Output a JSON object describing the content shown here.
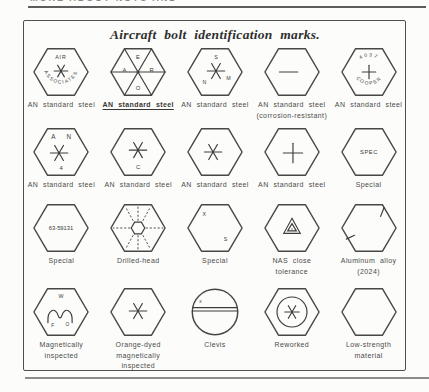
{
  "page": {
    "header_fragment": "MORE ABOUT NUTS AND BOLTS",
    "title": "Aircraft bolt identification marks."
  },
  "colors": {
    "ink": "#3c3c3c",
    "rule": "#5c5c5c",
    "paper": "#fcfcfa"
  },
  "cells": [
    {
      "name": "air-associates-bolt",
      "symbol": "asterisk",
      "marks": {
        "top": "AIR",
        "arc": "ASSOCIATES"
      },
      "label": [
        "AN standard steel"
      ]
    },
    {
      "name": "aero-spokes-bolt",
      "symbol": "six-spokes",
      "marks": {
        "top": "E",
        "left": "A",
        "right": "R",
        "bottom": "O"
      },
      "label": [
        "AN standard steel"
      ]
    },
    {
      "name": "snm-asterisk-bolt",
      "symbol": "asterisk",
      "marks": {
        "top": "S",
        "left": "N",
        "right": "M"
      },
      "label": [
        "AN standard steel"
      ]
    },
    {
      "name": "dash-bolt",
      "symbol": "single-dash",
      "marks": {},
      "label": [
        "AN standard steel",
        "(corrosion-resistant)"
      ]
    },
    {
      "name": "cooper-bolt",
      "symbol": "plus",
      "marks": {
        "arc_top": "4037",
        "arc_bottom": "COOPER"
      },
      "label": [
        "AN standard steel"
      ]
    },
    {
      "name": "an4-bolt",
      "symbol": "asterisk",
      "marks": {
        "left": "A",
        "right": "N",
        "bottom": "4"
      },
      "label": [
        "AN standard steel"
      ]
    },
    {
      "name": "c-asterisk-bolt",
      "symbol": "asterisk",
      "marks": {
        "bottom": "C"
      },
      "label": [
        "AN standard steel"
      ]
    },
    {
      "name": "asterisk-bolt",
      "symbol": "asterisk",
      "marks": {},
      "label": [
        "AN standard steel"
      ]
    },
    {
      "name": "plus-bolt",
      "symbol": "plus",
      "marks": {},
      "label": [
        "AN standard steel"
      ]
    },
    {
      "name": "spec-bolt",
      "symbol": "text-only",
      "marks": {
        "center": "SPEC"
      },
      "label": [
        "Special"
      ]
    },
    {
      "name": "part-number-bolt",
      "symbol": "text-only",
      "marks": {
        "center": "63-59131"
      },
      "label": [
        "Special"
      ]
    },
    {
      "name": "drilled-head-bolt",
      "symbol": "drilled-head-radials",
      "marks": {},
      "label": [
        "Drilled-head"
      ]
    },
    {
      "name": "xs-bolt",
      "symbol": "letters",
      "marks": {
        "top_left": "X",
        "bottom_right": "S"
      },
      "label": [
        "Special"
      ]
    },
    {
      "name": "nas-triangle-bolt",
      "symbol": "nested-triangle",
      "marks": {
        "inner": "x"
      },
      "label": [
        "NAS close",
        "tolerance"
      ]
    },
    {
      "name": "aluminum-alloy-bolt",
      "symbol": "raised-dashes",
      "marks": {},
      "label": [
        "Aluminum alloy",
        "(2024)"
      ]
    },
    {
      "name": "magnetic-inspected-bolt",
      "symbol": "m-arch-logo",
      "marks": {
        "top": "W",
        "bottom_left": "F",
        "bottom_right": "O"
      },
      "label": [
        "Magnetically",
        "inspected"
      ]
    },
    {
      "name": "orange-dyed-bolt",
      "symbol": "asterisk",
      "marks": {},
      "label": [
        "Orange-dyed",
        "magnetically",
        "inspected"
      ]
    },
    {
      "name": "clevis-bolt",
      "symbol": "circle-slot",
      "marks": {
        "top_left": "x"
      },
      "label": [
        "Clevis"
      ]
    },
    {
      "name": "reworked-bolt",
      "symbol": "circle-asterisk",
      "marks": {},
      "label": [
        "Reworked"
      ]
    },
    {
      "name": "low-strength-bolt",
      "symbol": "plain-hex",
      "marks": {},
      "label": [
        "Low-strength",
        "material"
      ]
    }
  ]
}
